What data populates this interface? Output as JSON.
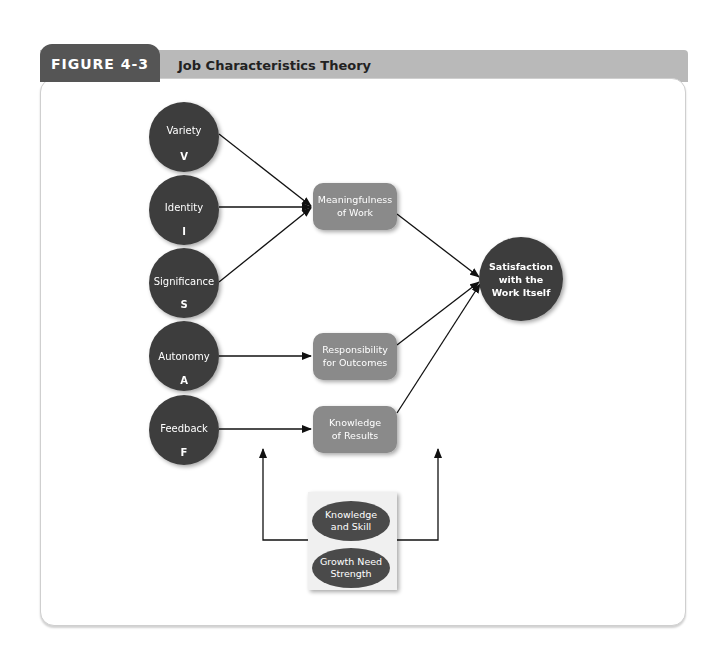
{
  "figure": {
    "label": "FIGURE 4-3",
    "title": "Job Characteristics Theory"
  },
  "colors": {
    "tab": "#555555",
    "header_bar": "#b9b9b9",
    "core_circle": "#3d3d3d",
    "state_box": "#8a8a8a",
    "outcome_circle": "#3d3d3d",
    "moderator_ellipse": "#4a4a4a",
    "arrow": "#111111"
  },
  "core_dimensions": [
    {
      "label": "Variety",
      "abbr": "V"
    },
    {
      "label": "Identity",
      "abbr": "I"
    },
    {
      "label": "Significance",
      "abbr": "S"
    },
    {
      "label": "Autonomy",
      "abbr": "A"
    },
    {
      "label": "Feedback",
      "abbr": "F"
    }
  ],
  "psychological_states": [
    {
      "line1": "Meaningfulness",
      "line2": "of Work"
    },
    {
      "line1": "Responsibility",
      "line2": "for Outcomes"
    },
    {
      "line1": "Knowledge",
      "line2": "of Results"
    }
  ],
  "outcome": {
    "line1": "Satisfaction",
    "line2": "with the",
    "line3": "Work Itself"
  },
  "moderators": [
    {
      "line1": "Knowledge",
      "line2": "and Skill"
    },
    {
      "line1": "Growth Need",
      "line2": "Strength"
    }
  ],
  "edges": [
    {
      "from": "Variety",
      "to": "Meaningfulness of Work"
    },
    {
      "from": "Identity",
      "to": "Meaningfulness of Work"
    },
    {
      "from": "Significance",
      "to": "Meaningfulness of Work"
    },
    {
      "from": "Autonomy",
      "to": "Responsibility for Outcomes"
    },
    {
      "from": "Feedback",
      "to": "Knowledge of Results"
    },
    {
      "from": "Meaningfulness of Work",
      "to": "Satisfaction with the Work Itself"
    },
    {
      "from": "Responsibility for Outcomes",
      "to": "Satisfaction with the Work Itself"
    },
    {
      "from": "Knowledge of Results",
      "to": "Satisfaction with the Work Itself"
    },
    {
      "from": "Moderators",
      "to": "Core-to-State links (moderation)"
    },
    {
      "from": "Moderators",
      "to": "State-to-Outcome links (moderation)"
    }
  ]
}
